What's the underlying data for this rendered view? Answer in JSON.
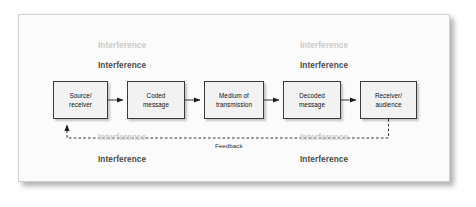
{
  "figure": {
    "kind": "communication-process-diagram",
    "background_color": "#fbfbfb",
    "frame_border_color": "#cfcfcf"
  },
  "process": {
    "boxes": [
      {
        "id": "source",
        "label": "Source/\nreceiver"
      },
      {
        "id": "coded",
        "label": "Coded\nmessage"
      },
      {
        "id": "medium",
        "label": "Medium of\ntransmission"
      },
      {
        "id": "decoded",
        "label": "Decoded\nmessage"
      },
      {
        "id": "receiver",
        "label": "Receiver/\naudience"
      }
    ],
    "box_fill_color": "#f2f2f2",
    "box_border_color": "#3a3a3a"
  },
  "connectors": {
    "forward_arrow_count": 4,
    "forward_style": "solid",
    "feedback_style": "dashed",
    "feedback_label": "Feedback",
    "line_color": "#222222"
  },
  "interference": {
    "text": "Interference",
    "light_color": "#cacaca",
    "dark_color": "#4a4a4a",
    "labels": [
      {
        "id": "top-left-light",
        "text": "Interference",
        "tone": "light"
      },
      {
        "id": "top-left-dark",
        "text": "Interference",
        "tone": "dark"
      },
      {
        "id": "top-right-light",
        "text": "Interference",
        "tone": "light"
      },
      {
        "id": "top-right-dark",
        "text": "Interference",
        "tone": "dark"
      },
      {
        "id": "bottom-left-light",
        "text": "Interference",
        "tone": "light"
      },
      {
        "id": "bottom-left-dark",
        "text": "Interference",
        "tone": "dark"
      },
      {
        "id": "bottom-right-light",
        "text": "Interference",
        "tone": "light"
      },
      {
        "id": "bottom-right-dark",
        "text": "Interference",
        "tone": "dark"
      }
    ]
  }
}
